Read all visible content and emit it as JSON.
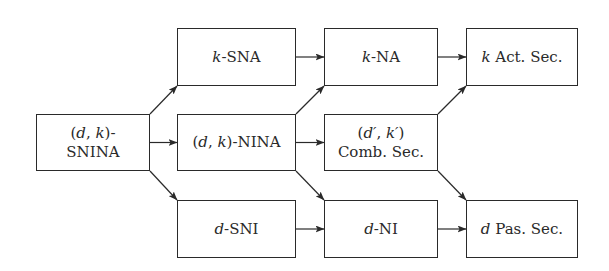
{
  "diagram": {
    "colors": {
      "stroke": "#2a2a2a",
      "text": "#2a2a2a",
      "background": "#ffffff"
    },
    "nodes": [
      {
        "id": "snina",
        "line1": "(d, k)-",
        "line2": "SNINA",
        "x": 36,
        "y": 114,
        "w": 114,
        "h": 57
      },
      {
        "id": "ksna",
        "var": "k",
        "text": "-SNA",
        "x": 177,
        "y": 28,
        "w": 119,
        "h": 58
      },
      {
        "id": "nina",
        "var": "(d, k)",
        "text": "-NINA",
        "x": 177,
        "y": 114,
        "w": 119,
        "h": 57
      },
      {
        "id": "dsni",
        "var": "d",
        "text": "-SNI",
        "x": 177,
        "y": 200,
        "w": 119,
        "h": 58
      },
      {
        "id": "kna",
        "var": "k",
        "text": "-NA",
        "x": 324,
        "y": 28,
        "w": 114,
        "h": 58
      },
      {
        "id": "comb",
        "line1": "(d′, k′)",
        "line2": "Comb. Sec.",
        "x": 324,
        "y": 114,
        "w": 114,
        "h": 57
      },
      {
        "id": "dni",
        "var": "d",
        "text": "-NI",
        "x": 324,
        "y": 200,
        "w": 114,
        "h": 58
      },
      {
        "id": "kact",
        "var": "k",
        "text": " Act. Sec.",
        "x": 466,
        "y": 28,
        "w": 112,
        "h": 58
      },
      {
        "id": "dpas",
        "var": "d",
        "text": " Pas. Sec.",
        "x": 466,
        "y": 200,
        "w": 112,
        "h": 58
      }
    ],
    "edges": [
      {
        "from": "snina",
        "to": "ksna"
      },
      {
        "from": "snina",
        "to": "nina"
      },
      {
        "from": "snina",
        "to": "dsni"
      },
      {
        "from": "ksna",
        "to": "kna"
      },
      {
        "from": "nina",
        "to": "kna"
      },
      {
        "from": "nina",
        "to": "comb"
      },
      {
        "from": "nina",
        "to": "dni"
      },
      {
        "from": "dsni",
        "to": "dni"
      },
      {
        "from": "kna",
        "to": "kact"
      },
      {
        "from": "comb",
        "to": "kact"
      },
      {
        "from": "comb",
        "to": "dpas"
      },
      {
        "from": "dni",
        "to": "dpas"
      }
    ]
  }
}
